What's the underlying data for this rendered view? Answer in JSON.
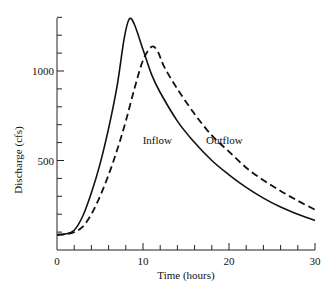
{
  "chart_data": {
    "type": "line",
    "title": "",
    "xlabel": "Time (hours)",
    "ylabel": "Discharge (cfs)",
    "xlim": [
      0,
      30
    ],
    "ylim": [
      0,
      1350
    ],
    "xticks_labeled": [
      0,
      10,
      20,
      30
    ],
    "xtick_minor_step": 2,
    "yticks_labeled": [
      500,
      1000
    ],
    "ytick_minor_step": 100,
    "origin_label": "0",
    "grid": false,
    "legend": "inline annotations",
    "annotations": [
      {
        "text": "Inflow",
        "x": 12.5,
        "y": 620
      },
      {
        "text": "Outflow",
        "x": 17,
        "y": 620
      }
    ],
    "series": [
      {
        "name": "Inflow",
        "style": "solid",
        "x": [
          0,
          1,
          2,
          3,
          4,
          5,
          6,
          7,
          7.8,
          8.4,
          9,
          10,
          11,
          12,
          14,
          16,
          18,
          20,
          22,
          24,
          26,
          28,
          30
        ],
        "values": [
          85,
          90,
          110,
          190,
          320,
          480,
          680,
          920,
          1180,
          1290,
          1260,
          1120,
          980,
          880,
          720,
          600,
          500,
          420,
          350,
          290,
          240,
          200,
          165
        ]
      },
      {
        "name": "Outflow",
        "style": "dashed",
        "x": [
          0,
          1,
          2,
          3,
          4,
          5,
          6,
          7,
          8,
          9,
          10,
          11,
          11.7,
          12.5,
          14,
          16,
          18,
          20,
          22,
          24,
          26,
          28,
          30
        ],
        "values": [
          85,
          88,
          100,
          130,
          200,
          300,
          420,
          560,
          720,
          900,
          1060,
          1135,
          1110,
          1020,
          900,
          760,
          640,
          550,
          460,
          390,
          330,
          275,
          225
        ]
      }
    ]
  }
}
